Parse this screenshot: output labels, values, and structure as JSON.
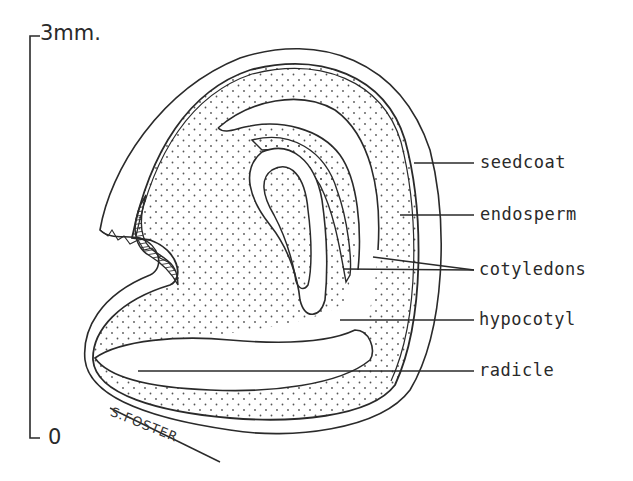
{
  "diagram": {
    "scale_bar": {
      "top_label": "3mm.",
      "bottom_label": "0"
    },
    "labels": [
      {
        "id": "seedcoat",
        "text": "seedcoat"
      },
      {
        "id": "endosperm",
        "text": "endosperm"
      },
      {
        "id": "cotyledons",
        "text": "cotyledons"
      },
      {
        "id": "hypocotyl",
        "text": "hypocotyl"
      },
      {
        "id": "radicle",
        "text": "radicle"
      }
    ],
    "signature": "S.FOSTER"
  },
  "colors": {
    "ink": "#2a2a2a",
    "background": "#ffffff"
  }
}
